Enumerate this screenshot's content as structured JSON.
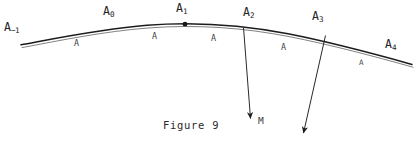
{
  "figure": {
    "caption": "Figure 9",
    "background_color": "#ffffff",
    "ink_color": "#232323",
    "vertex_labels": [
      {
        "id": "a-minus-1",
        "base": "A",
        "sub": "−1",
        "x": 4,
        "y": 22
      },
      {
        "id": "a-0",
        "base": "A",
        "sub": "0",
        "x": 103,
        "y": 6
      },
      {
        "id": "a-1",
        "base": "A",
        "sub": "1",
        "x": 176,
        "y": 3
      },
      {
        "id": "a-2",
        "base": "A",
        "sub": "2",
        "x": 243,
        "y": 7
      },
      {
        "id": "a-3",
        "base": "A",
        "sub": "3",
        "x": 312,
        "y": 11
      },
      {
        "id": "a-4",
        "base": "A",
        "sub": "4",
        "x": 385,
        "y": 39
      }
    ],
    "segment_labels": [
      {
        "id": "seg-1",
        "text": "A",
        "x": 74,
        "y": 39,
        "faint": false
      },
      {
        "id": "seg-2",
        "text": "A",
        "x": 152,
        "y": 32,
        "faint": false
      },
      {
        "id": "seg-3",
        "text": "A",
        "x": 211,
        "y": 34,
        "faint": false
      },
      {
        "id": "seg-4",
        "text": "A",
        "x": 281,
        "y": 43,
        "faint": false
      },
      {
        "id": "seg-5",
        "text": "A",
        "x": 359,
        "y": 59,
        "faint": true
      }
    ],
    "point_marker": {
      "id": "a-1-dot",
      "x": 185,
      "y": 24.2,
      "r": 2.4
    },
    "arrows": [
      {
        "id": "arrow-from-a2",
        "from_x": 243.5,
        "from_y": 27.5,
        "to_x": 250.5,
        "to_y": 118.5
      },
      {
        "id": "arrow-from-a3",
        "from_x": 325.5,
        "from_y": 35.5,
        "to_x": 303.5,
        "to_y": 133.0
      }
    ],
    "m_label": {
      "text": "M",
      "x": 258,
      "y": 116
    },
    "caption_position": {
      "x": 163,
      "y": 120
    },
    "curve": {
      "outer_path": "M 21,44.8 C 60,37.5 103,28.6 147,25.2 C 196,21.4 243,25.0 288,33.8 C 330,42.0 374,53.8 412,64.4",
      "inner_path": "M 22,47.6 C 61,40.3 104,31.4 148,28.0 C 197,24.2 244,27.8 289,36.6 C 331,44.8 375,56.6 413,67.2",
      "outer_width": 1.55,
      "inner_width": 0.85
    }
  }
}
